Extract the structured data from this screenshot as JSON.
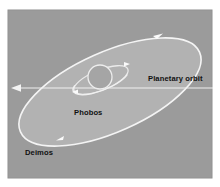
{
  "figure": {
    "background_color": "#ffffff",
    "panel_color": "#9a9a9a",
    "panel_border_color": "#8c8c8c",
    "orbit_fill_color": "#b4b4b4",
    "orbit_stroke_color": "#f2f2f2",
    "line_color": "#ededed",
    "text_color": "#111111",
    "planet_fill_color": "#a3a3a3"
  },
  "labels": {
    "planetary_orbit": "Planetary orbit",
    "phobos": "Phobos",
    "deimos": "Deimos"
  },
  "diagram_data": {
    "type": "diagram",
    "panel": {
      "x": 8,
      "y": 10,
      "width": 204,
      "height": 168
    },
    "deimos_orbit": {
      "name": "Deimos orbit",
      "shape": "ellipse",
      "cx": 110,
      "cy": 92,
      "rx": 98,
      "ry": 40,
      "rotation_deg": -24,
      "marker_count": 2
    },
    "phobos_orbit": {
      "name": "Phobos orbit",
      "shape": "ellipse",
      "cx": 101,
      "cy": 80,
      "rx": 29,
      "ry": 10,
      "rotation_deg": -22,
      "marker_count": 2
    },
    "planet": {
      "name": "Mars",
      "shape": "circle",
      "cx": 100,
      "cy": 77,
      "r": 12
    },
    "planetary_orbit_line": {
      "name": "Planetary orbit axis",
      "shape": "arrow-line",
      "x1": 213,
      "y1": 88,
      "x2": 12,
      "y2": 88,
      "arrowhead": "left"
    }
  }
}
